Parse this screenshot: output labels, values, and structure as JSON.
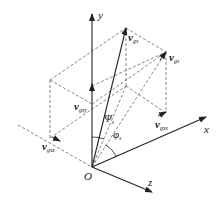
{
  "diagram": {
    "axes": {
      "y_label": "y",
      "x_label": "x",
      "z_label": "z",
      "origin_label": "O"
    },
    "vectors": {
      "v_gs": {
        "symbol": "v",
        "subscript": "gs"
      },
      "v_gs_prime": {
        "symbol": "v",
        "subscript": "gs"
      },
      "v_gsy": {
        "symbol": "v",
        "subscript": "gsy"
      },
      "v_gsz": {
        "symbol": "v",
        "subscript": "gsz"
      },
      "v_gsx": {
        "symbol": "v",
        "subscript": "gsx"
      }
    },
    "angles": {
      "psi": {
        "symbol": "Ψ",
        "subscript": "s"
      },
      "phi": {
        "symbol": "φ",
        "subscript": "s"
      }
    },
    "colors": {
      "line": "#222222",
      "dashed": "#555555",
      "background": "#ffffff"
    }
  }
}
